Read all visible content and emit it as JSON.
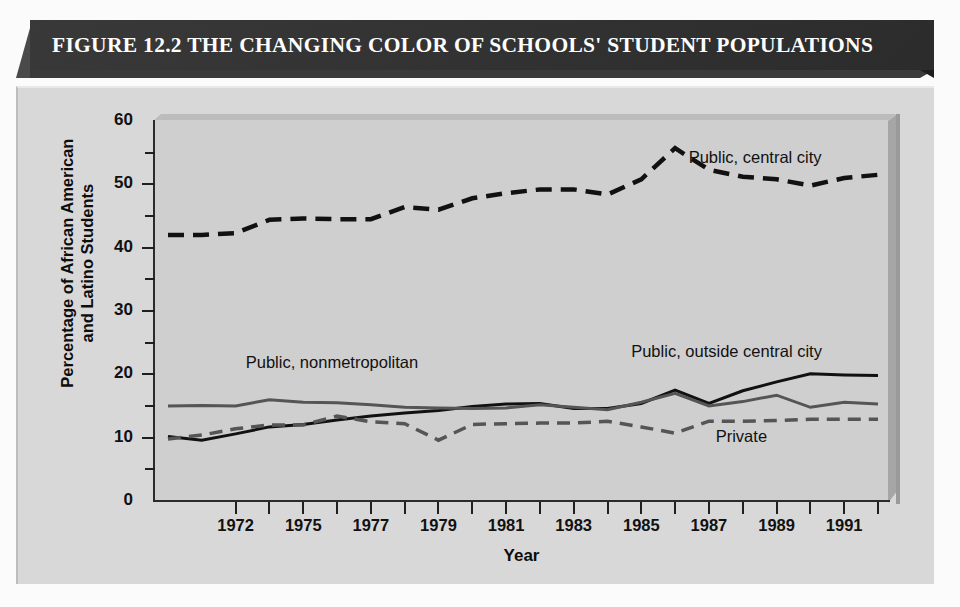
{
  "figure": {
    "title": "FIGURE 12.2   THE CHANGING COLOR OF SCHOOLS' STUDENT POPULATIONS"
  },
  "colors": {
    "title_bar": "#2e2e2e",
    "panel": "#cfcfcf",
    "frame": "#d8d8d8",
    "axis": "#2b2b2b",
    "series_dark": "#111111",
    "series_gray": "#555555"
  },
  "chart_data": {
    "type": "line",
    "title": "FIGURE 12.2   THE CHANGING COLOR OF SCHOOLS' STUDENT POPULATIONS",
    "xlabel": "Year",
    "ylabel": "Percentage of African American and Latino Students",
    "ylabel_line1": "Percentage of African American",
    "ylabel_line2": "and Latino Students",
    "xlim": [
      1970,
      1991
    ],
    "ylim": [
      0,
      60
    ],
    "grid": false,
    "legend_position": "inline-annotations",
    "y_ticks_major": [
      0,
      10,
      20,
      30,
      40,
      50,
      60
    ],
    "y_ticks_minor": [
      5,
      15,
      25,
      35,
      45,
      55
    ],
    "x_ticks": [
      1970,
      1971,
      1972,
      1973,
      1974,
      1975,
      1976,
      1977,
      1978,
      1979,
      1980,
      1981,
      1982,
      1983,
      1984,
      1985,
      1986,
      1987,
      1988,
      1989,
      1990,
      1991
    ],
    "x_tick_labels": [
      "1972",
      "1975",
      "1977",
      "1979",
      "1981",
      "1983",
      "1985",
      "1987",
      "1989",
      "1991"
    ],
    "x": [
      1970,
      1971,
      1972,
      1973,
      1974,
      1975,
      1976,
      1977,
      1978,
      1979,
      1980,
      1981,
      1982,
      1983,
      1984,
      1985,
      1986,
      1987,
      1988,
      1989,
      1990,
      1991
    ],
    "series": [
      {
        "name": "Public, central city",
        "style": "dashed",
        "color": "#111111",
        "width": 4.5,
        "label_x": 1985.4,
        "label_y": 54.0,
        "values": [
          42.0,
          42.0,
          42.3,
          44.4,
          44.6,
          44.5,
          44.5,
          46.4,
          46.0,
          47.8,
          48.6,
          49.2,
          49.2,
          48.4,
          50.8,
          55.7,
          52.3,
          51.2,
          50.8,
          49.8,
          51.0,
          51.5
        ]
      },
      {
        "name": "Public, outside central city",
        "style": "solid",
        "color": "#111111",
        "width": 3.0,
        "label_x": 1983.7,
        "label_y": 23.3,
        "values": [
          10.2,
          9.6,
          10.6,
          11.7,
          12.1,
          12.8,
          13.4,
          13.9,
          14.3,
          14.9,
          15.3,
          15.4,
          14.6,
          14.6,
          15.4,
          17.5,
          15.4,
          17.4,
          18.8,
          20.1,
          19.9,
          19.8
        ]
      },
      {
        "name": "Public, nonmetropolitan",
        "style": "solid",
        "color": "#555555",
        "width": 3.0,
        "label_x": 1972.3,
        "label_y": 21.7,
        "values": [
          15.0,
          15.1,
          15.0,
          16.0,
          15.6,
          15.5,
          15.2,
          14.8,
          14.7,
          14.6,
          14.7,
          15.2,
          14.8,
          14.4,
          15.6,
          17.0,
          15.0,
          15.7,
          16.7,
          14.8,
          15.6,
          15.3
        ]
      },
      {
        "name": "Private",
        "style": "dashed",
        "color": "#555555",
        "width": 3.5,
        "label_x": 1986.2,
        "label_y": 10.0,
        "values": [
          9.8,
          10.4,
          11.4,
          12.0,
          12.0,
          13.4,
          12.5,
          12.2,
          9.6,
          12.1,
          12.2,
          12.3,
          12.3,
          12.6,
          11.7,
          10.7,
          12.6,
          12.6,
          12.7,
          12.9,
          12.9,
          12.9
        ]
      }
    ]
  }
}
